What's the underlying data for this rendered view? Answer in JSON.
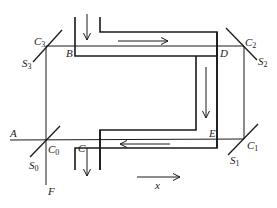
{
  "diagram": {
    "type": "Fizeau-type interferometer with flowing-water tube",
    "labels": {
      "A": "A",
      "B": "B",
      "C": "C",
      "D": "D",
      "E": "E",
      "F": "F",
      "x": "x",
      "C0": {
        "base": "C",
        "sub": "0"
      },
      "C1": {
        "base": "C",
        "sub": "1"
      },
      "C2": {
        "base": "C",
        "sub": "2"
      },
      "C3": {
        "base": "C",
        "sub": "3"
      },
      "S0": {
        "base": "S",
        "sub": "0"
      },
      "S1": {
        "base": "S",
        "sub": "1"
      },
      "S2": {
        "base": "S",
        "sub": "2"
      },
      "S3": {
        "base": "S",
        "sub": "3"
      }
    },
    "arrows": [
      {
        "name": "inflow-arrow",
        "direction": "down"
      },
      {
        "name": "top-flow-arrow",
        "direction": "right"
      },
      {
        "name": "right-flow-arrow",
        "direction": "down"
      },
      {
        "name": "bottom-flow-arrow",
        "direction": "left"
      },
      {
        "name": "outflow-arrow",
        "direction": "down"
      },
      {
        "name": "x-axis-arrow",
        "direction": "right"
      }
    ],
    "colors": {
      "line": "#1a1a1a",
      "background": "#ffffff"
    }
  }
}
